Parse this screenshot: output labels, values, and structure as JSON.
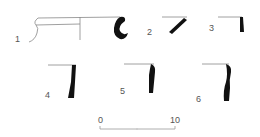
{
  "figure": {
    "type": "pottery rim profiles",
    "colors": {
      "line": "#777777",
      "profile_fill": "#111111",
      "label": "#555555"
    },
    "sherds": [
      {
        "id": 1,
        "label": "1"
      },
      {
        "id": 2,
        "label": "2"
      },
      {
        "id": 3,
        "label": "3"
      },
      {
        "id": 4,
        "label": "4"
      },
      {
        "id": 5,
        "label": "5"
      },
      {
        "id": 6,
        "label": "6"
      }
    ],
    "scale": {
      "start_label": "0",
      "end_label": "10"
    }
  }
}
